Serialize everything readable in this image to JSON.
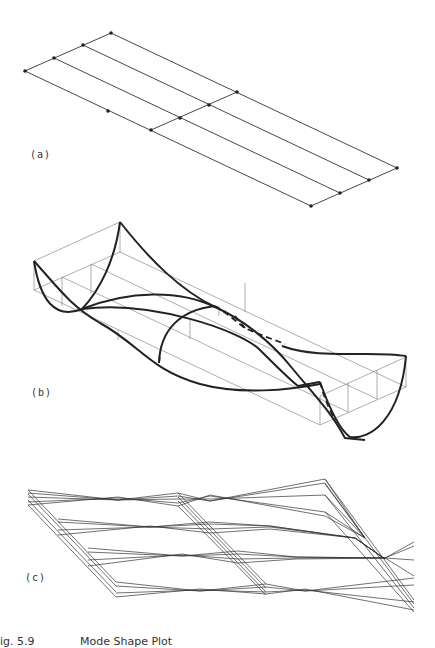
{
  "figure": {
    "caption_number": "ig. 5.9",
    "caption_title": "Mode Shape Plot",
    "panels": [
      {
        "label": "(a)",
        "description": "Undeformed finite element grid (3x2 plate mesh with nodes)"
      },
      {
        "label": "(b)",
        "description": "Deformed mode shape, curved surface over box outline"
      },
      {
        "label": "(c)",
        "description": "Superimposed mode shape animation frames (wireframe)"
      }
    ]
  },
  "colors": {
    "line": "#333333",
    "thick": "#222222",
    "thin": "#777777",
    "background": "#ffffff"
  }
}
